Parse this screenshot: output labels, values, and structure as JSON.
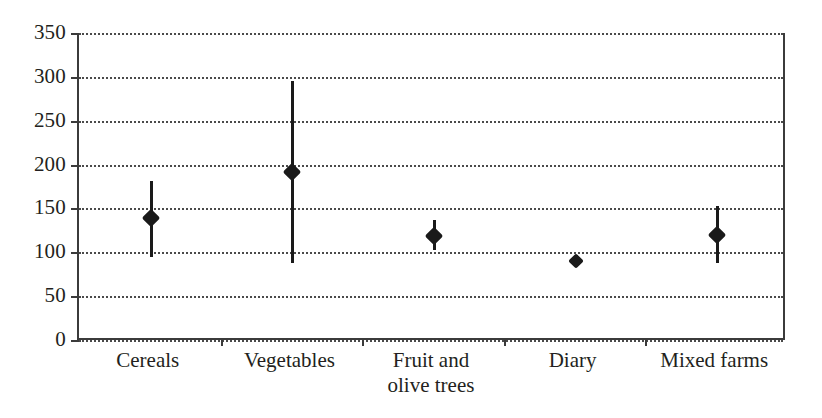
{
  "chart_data": {
    "type": "scatter",
    "title": "",
    "xlabel": "",
    "ylabel": "",
    "categories": [
      "Cereals",
      "Vegetables",
      "Fruit and\nolive trees",
      "Diary",
      "Mixed farms"
    ],
    "values": [
      139,
      192,
      119,
      90,
      120
    ],
    "error_low": [
      95,
      88,
      103,
      84,
      88
    ],
    "error_high": [
      181,
      295,
      137,
      97,
      153
    ],
    "ylim": [
      0,
      350
    ],
    "yticks": [
      0,
      50,
      100,
      150,
      200,
      250,
      300,
      350
    ],
    "ytick_labels": [
      "0",
      "50",
      "100",
      "150",
      "200",
      "250",
      "300",
      "350"
    ],
    "grid": true,
    "grid_axis": "y",
    "grid_style": "dotted",
    "legend": "none",
    "marker": "diamond",
    "series": [
      {
        "name": "Estimate with range",
        "points": [
          {
            "category": "Cereals",
            "value": 139,
            "low": 95,
            "high": 181
          },
          {
            "category": "Vegetables",
            "value": 192,
            "low": 88,
            "high": 295
          },
          {
            "category": "Fruit and olive trees",
            "value": 119,
            "low": 103,
            "high": 137
          },
          {
            "category": "Diary",
            "value": 90,
            "low": 84,
            "high": 97
          },
          {
            "category": "Mixed farms",
            "value": 120,
            "low": 88,
            "high": 153
          }
        ]
      }
    ],
    "colors": {
      "marker": "#1a1a1a",
      "errorbar": "#1a1a1a",
      "axis": "#3b3b3b",
      "grid": "#4a4a4a",
      "background": "#ffffff"
    }
  }
}
